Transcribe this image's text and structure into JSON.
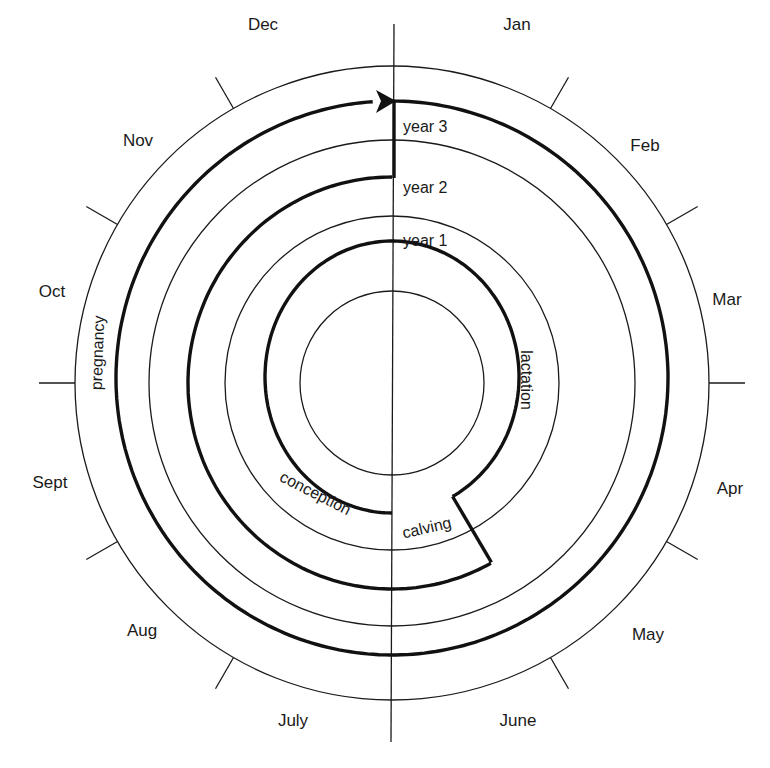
{
  "diagram": {
    "center": {
      "x": 393,
      "y": 383
    },
    "months": [
      {
        "label": "Jan",
        "x": 517,
        "y": 30
      },
      {
        "label": "Feb",
        "x": 645,
        "y": 151
      },
      {
        "label": "Mar",
        "x": 727,
        "y": 305
      },
      {
        "label": "Apr",
        "x": 730,
        "y": 494
      },
      {
        "label": "May",
        "x": 648,
        "y": 640
      },
      {
        "label": "June",
        "x": 518,
        "y": 726
      },
      {
        "label": "July",
        "x": 293,
        "y": 726
      },
      {
        "label": "Aug",
        "x": 142,
        "y": 636
      },
      {
        "label": "Sept",
        "x": 50,
        "y": 488
      },
      {
        "label": "Oct",
        "x": 52,
        "y": 297
      },
      {
        "label": "Nov",
        "x": 138,
        "y": 146
      },
      {
        "label": "Dec",
        "x": 263,
        "y": 30
      }
    ],
    "years": [
      {
        "label": "year 1",
        "x": 403,
        "y": 246
      },
      {
        "label": "year 2",
        "x": 403,
        "y": 193
      },
      {
        "label": "year 3",
        "x": 403,
        "y": 130
      }
    ],
    "phases": {
      "lactation": "lactation",
      "calving": "calving",
      "conception": "conception",
      "pregnancy": "pregnancy"
    },
    "colors": {
      "line": "#1a1a1a",
      "background": "#ffffff"
    }
  }
}
